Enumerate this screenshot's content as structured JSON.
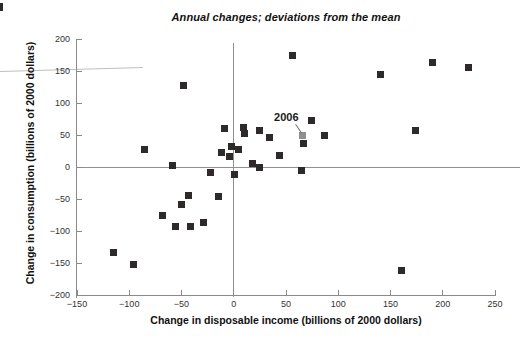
{
  "colors": {
    "marker": "#2e2a2a",
    "highlight_marker": "#8f8f8f",
    "axis": "#8a8a8a",
    "zero_line": "#909090",
    "text": "#111111",
    "tick_text": "#333333",
    "annotation_line": "#777777"
  },
  "chart_data": {
    "type": "scatter",
    "title": "Annual changes; deviations from the mean",
    "xlabel": "Change in disposable income (billions of 2000 dollars)",
    "ylabel": "Change in consumption (billions of 2000 dollars)",
    "xlim": [
      -150,
      250
    ],
    "ylim": [
      -200,
      200
    ],
    "grid": false,
    "xticks": [
      -150,
      -100,
      -50,
      0,
      50,
      100,
      150,
      200,
      250
    ],
    "xtick_labels": [
      "−150",
      "−100",
      "−50",
      "0",
      "50",
      "100",
      "150",
      "200",
      "250"
    ],
    "yticks": [
      200,
      150,
      100,
      50,
      0,
      -50,
      -100,
      -150,
      -200
    ],
    "ytick_labels": [
      "200",
      "150",
      "100",
      "50",
      "0",
      "−50",
      "−100",
      "−150",
      "−200"
    ],
    "zero_lines": {
      "vertical_at_x": 0,
      "horizontal_at_y": 0
    },
    "points": [
      [
        -115,
        -133
      ],
      [
        -96,
        -152
      ],
      [
        -85,
        28
      ],
      [
        -68,
        -76
      ],
      [
        -59,
        3
      ],
      [
        -56,
        -93
      ],
      [
        -50,
        -59
      ],
      [
        -48,
        127
      ],
      [
        -43,
        -45
      ],
      [
        -41,
        -93
      ],
      [
        -29,
        -87
      ],
      [
        -22,
        -8
      ],
      [
        -15,
        -46
      ],
      [
        -12,
        22
      ],
      [
        -9,
        60
      ],
      [
        -4,
        16
      ],
      [
        -2,
        32
      ],
      [
        1,
        -12
      ],
      [
        5,
        28
      ],
      [
        9,
        61
      ],
      [
        10,
        52
      ],
      [
        18,
        5
      ],
      [
        25,
        -1
      ],
      [
        25,
        57
      ],
      [
        34,
        46
      ],
      [
        44,
        18
      ],
      [
        56,
        175
      ],
      [
        65,
        -5
      ],
      [
        67,
        37
      ],
      [
        74,
        73
      ],
      [
        87,
        49
      ],
      [
        140,
        144
      ],
      [
        161,
        -162
      ],
      [
        174,
        57
      ],
      [
        190,
        164
      ],
      [
        225,
        156
      ]
    ],
    "highlight_point": {
      "x": 66,
      "y": 50,
      "label": "2006",
      "color": "#8f8f8f"
    },
    "annotation": {
      "text": "2006",
      "text_pos": [
        50.3,
        78
      ],
      "line_from": [
        59.5,
        67
      ],
      "line_to": [
        65.3,
        53
      ]
    }
  }
}
